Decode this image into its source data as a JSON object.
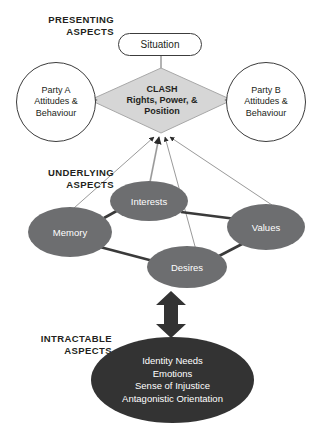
{
  "diagram": {
    "sections": [
      {
        "id": "presenting",
        "label": "PRESENTING\nASPECTS"
      },
      {
        "id": "underlying",
        "label": "UNDERLYING\nASPECTS"
      },
      {
        "id": "intractable",
        "label": "INTRACTABLE\nASPECTS"
      }
    ],
    "presenting": {
      "situation": {
        "label": "Situation",
        "shape": "rounded-rectangle",
        "fill": "#ffffff",
        "stroke": "#3c3c3c"
      },
      "clash": {
        "label": "CLASH\nRights, Power, &\nPosition",
        "line1": "CLASH",
        "line2": "Rights, Power, &",
        "line3": "Position",
        "shape": "diamond",
        "fill": "#d6d6d6",
        "stroke": "#8a8a8a"
      },
      "party_a": {
        "label": "Party A\nAttitudes &\nBehaviour",
        "line1": "Party A",
        "line2": "Attitudes &",
        "line3": "Behaviour",
        "shape": "circle",
        "fill": "#ffffff",
        "stroke": "#3c3c3c"
      },
      "party_b": {
        "label": "Party B\nAttitudes &\nBehaviour",
        "line1": "Party B",
        "line2": "Attitudes &",
        "line3": "Behaviour",
        "shape": "circle",
        "fill": "#ffffff",
        "stroke": "#3c3c3c"
      }
    },
    "underlying": {
      "fill": "#6d6e70",
      "text_color": "#ffffff",
      "nodes": [
        {
          "id": "memory",
          "label": "Memory"
        },
        {
          "id": "interests",
          "label": "Interests"
        },
        {
          "id": "desires",
          "label": "Desires"
        },
        {
          "id": "values",
          "label": "Values"
        }
      ]
    },
    "intractable": {
      "label": "Identity Needs\nEmotions\nSense of Injustice\nAntagonistic Orientation",
      "items": [
        "Identity Needs",
        "Emotions",
        "Sense of Injustice",
        "Antagonistic Orientation"
      ],
      "shape": "ellipse",
      "fill": "#333333",
      "text_color": "#ffffff"
    },
    "connectors": {
      "clash_to_party_a": {
        "type": "arrow",
        "direction": "left"
      },
      "clash_to_party_b": {
        "type": "arrow",
        "direction": "right"
      },
      "situation_to_clash": {
        "type": "line"
      },
      "underlying_to_clash": {
        "type": "arrow",
        "direction": "up",
        "count": 4
      },
      "intractable_to_desires": {
        "type": "double-arrow",
        "direction": "up-down",
        "fill": "#333333"
      }
    },
    "colors": {
      "diamond_fill": "#d6d6d6",
      "ellipse_fill": "#6d6e70",
      "intractable_fill": "#333333",
      "outline": "#3c3c3c",
      "thick_link": "#3a3a3a",
      "thin_link": "#9a9a9a",
      "text_dark": "#231f20",
      "background": "#ffffff"
    }
  }
}
